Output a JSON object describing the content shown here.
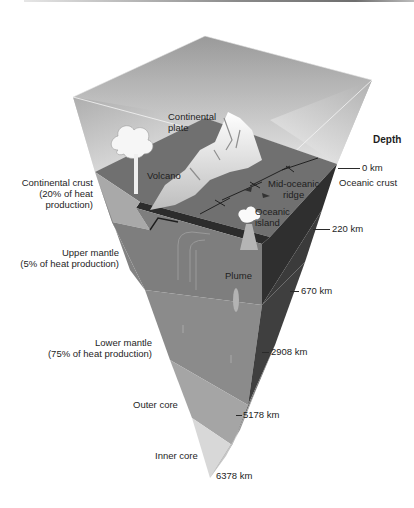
{
  "figure": {
    "depth_heading": "Depth",
    "surface_labels": {
      "continental_plate": [
        "Continental",
        "plate"
      ],
      "volcano": "Volcano",
      "mid_oceanic_ridge": [
        "Mid-oceanic",
        "ridge"
      ],
      "oceanic_island": [
        "Oceanic",
        "island"
      ],
      "plume": "Plume"
    },
    "layers": [
      {
        "name": "Continental crust",
        "detail": [
          "(20% of heat",
          "production)"
        ]
      },
      {
        "name": "Oceanic crust"
      },
      {
        "name": "Upper mantle",
        "detail": [
          "(5% of heat production)"
        ]
      },
      {
        "name": "Lower mantle",
        "detail": [
          "(75% of heat production)"
        ]
      },
      {
        "name": "Outer core"
      },
      {
        "name": "Inner core"
      }
    ],
    "depths": [
      "0 km",
      "220 km",
      "670 km",
      "2908 km",
      "5178 km",
      "6378 km"
    ],
    "colors": {
      "atmosphere_top": "#d2d2d2",
      "ground_surface": "#6f6f6f",
      "upper_mantle_left": "#7d7d7d",
      "upper_mantle_right": "#3a3a3a",
      "lower_mantle_left": "#8a8a8a",
      "lower_mantle_right": "#555555",
      "outer_core_left": "#a6a6a6",
      "outer_core_right": "#8c8c8c",
      "inner_core_left": "#d9d9d9",
      "inner_core_right": "#c4c4c4"
    }
  }
}
